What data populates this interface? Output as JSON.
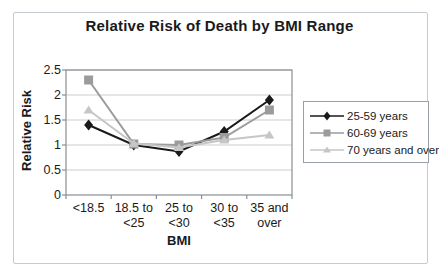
{
  "chart_data": {
    "type": "line",
    "title": "Relative Risk of Death by BMI Range",
    "xlabel": "BMI",
    "ylabel": "Relative Risk",
    "categories": [
      "<18.5",
      "18.5 to\n<25",
      "25 to\n<30",
      "30 to\n<35",
      "35 and\nover"
    ],
    "series": [
      {
        "name": "25-59 years",
        "marker": "diamond",
        "color": "#1a1a1a",
        "values": [
          1.4,
          1.0,
          0.87,
          1.27,
          1.9
        ]
      },
      {
        "name": "60-69 years",
        "marker": "square",
        "color": "#9b9b9b",
        "values": [
          2.3,
          1.02,
          1.0,
          1.15,
          1.7
        ]
      },
      {
        "name": "70 years and over",
        "marker": "triangle",
        "color": "#c6c6c6",
        "values": [
          1.7,
          1.03,
          0.95,
          1.1,
          1.2
        ]
      }
    ],
    "ylim": [
      0,
      2.5
    ],
    "yticks": [
      0,
      0.5,
      1,
      1.5,
      2,
      2.5
    ],
    "grid": true,
    "legend_position": "right"
  },
  "colors": {
    "gridline": "#c9cdd1",
    "axis": "#8a8f94",
    "legend_border": "#9aa0a6",
    "frame_border": "#c6cbd0",
    "background": "#ffffff",
    "text": "#1a1a1a"
  }
}
